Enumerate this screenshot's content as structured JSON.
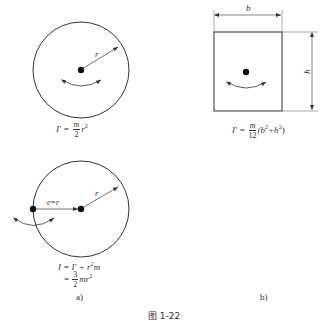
{
  "figure": {
    "caption": "图 1-22",
    "panel_a": {
      "label": "a)",
      "top_circle": {
        "radius_label": "r",
        "formula": {
          "lhs": "I′ =",
          "frac_num": "m",
          "frac_den": "2",
          "rhs": "r",
          "rhs_exp": "2"
        }
      },
      "bottom_circle": {
        "radius_label": "r",
        "offset_label": "e=r",
        "formula_line1": {
          "lhs": "I = I′ + r",
          "exp": "2",
          "tail": "m"
        },
        "formula_line2": {
          "eq": "=",
          "frac_num": "3",
          "frac_den": "2",
          "rhs": "mr",
          "rhs_exp": "2"
        }
      }
    },
    "panel_b": {
      "label": "b)",
      "width_label": "b",
      "height_label": "h",
      "formula": {
        "lhs": "I′ =",
        "frac_num": "m",
        "frac_den": "12",
        "rhs_open": "(b",
        "exp1": "2",
        "plus": "+h",
        "exp2": "2",
        "rhs_close": ")"
      }
    }
  }
}
